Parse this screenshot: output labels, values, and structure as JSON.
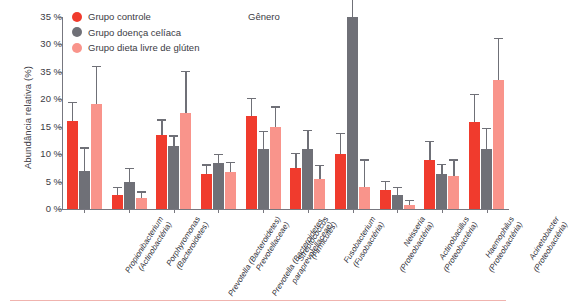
{
  "chart_data": {
    "type": "bar",
    "title": "Gênero",
    "xlabel": "",
    "ylabel": "Abundância relativa (%)",
    "ylim": [
      0,
      35
    ],
    "grid": false,
    "legend_position": "top-left",
    "ytick_labels": [
      "35 %",
      "30 %",
      "35 %",
      "20 %",
      "15 %",
      "10 %",
      "5 %",
      "0 %"
    ],
    "ytick_values": [
      35,
      30,
      25,
      20,
      15,
      10,
      5,
      0
    ],
    "categories": [
      "Propionibacterium (Actinobactéria)",
      "Porphyromonas (Bacteroidetes)",
      "Prevotella (Bacteroidetes) Prevotellaceae)",
      "Prevotella (Bacteroidetes, paraprevotellaceae)",
      "Streptococcus (Firmicutes)",
      "Fusobacterium (Fusobactéria)",
      "Neisseria (Proteobactéria)",
      "Actinobacillus (Proteobactéria)",
      "Haemophilus (Proteobactéria)",
      "Acinetobacter (Proteobactéria)"
    ],
    "category_lines": [
      [
        "Propionibacterium",
        "(Actinobactéria)"
      ],
      [
        "Porphyromonas",
        "(Bacteroidetes)"
      ],
      [
        "Prevotella (Bacteroidetes)",
        "Prevotellaceae)"
      ],
      [
        "Prevotella (Bacteroidetes,",
        "paraprevotellaceae)"
      ],
      [
        "Streptococcus",
        "(Firmicutes)"
      ],
      [
        "Fusobacterium",
        "(Fusobactéria)"
      ],
      [
        "Neisseria",
        "(Proteobactéria)"
      ],
      [
        "Actinobacillus",
        "(Proteobactéria)"
      ],
      [
        "Haemophilus",
        "(Proteobactéria)"
      ],
      [
        "Acinetobacter",
        "(Proteobactéria)"
      ]
    ],
    "series": [
      {
        "name": "Grupo controle",
        "color": "#f03b2d",
        "values": [
          16.0,
          2.5,
          13.5,
          6.3,
          17.0,
          7.5,
          10.0,
          3.5,
          9.0,
          15.8
        ],
        "errors": [
          3.3,
          1.3,
          2.6,
          1.6,
          3.0,
          2.5,
          3.6,
          1.4,
          3.2,
          5.0
        ]
      },
      {
        "name": "Grupo doença celíaca",
        "color": "#6f7077",
        "values": [
          7.0,
          5.0,
          11.5,
          8.3,
          11.0,
          11.0,
          35.0,
          2.5,
          6.3,
          11.0
        ],
        "errors": [
          4.0,
          2.3,
          1.7,
          1.5,
          3.0,
          3.2,
          4.0,
          1.3,
          1.7,
          3.5
        ]
      },
      {
        "name": "Grupo dieta livre de glúten",
        "color": "#f9948b",
        "values": [
          19.2,
          2.0,
          17.5,
          6.8,
          15.0,
          5.5,
          4.0,
          0.7,
          6.0,
          23.5
        ],
        "errors": [
          6.7,
          1.0,
          7.5,
          1.6,
          3.5,
          2.3,
          4.8,
          0.7,
          2.8,
          7.5
        ]
      }
    ]
  },
  "legend": {
    "items": [
      {
        "label": "Grupo controle",
        "color": "#f03b2d"
      },
      {
        "label": "Grupo doença celíaca",
        "color": "#6f7077"
      },
      {
        "label": "Grupo dieta livre de glúten",
        "color": "#f9948b"
      }
    ]
  },
  "colors": {
    "control": "#f03b2d",
    "celiac": "#6f7077",
    "gluten_free": "#f9948b",
    "axis": "#77777f",
    "text": "#3b3b44",
    "rule": "#f0b3ae"
  }
}
